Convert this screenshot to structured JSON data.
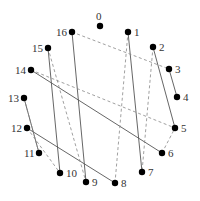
{
  "diagram": {
    "type": "circular-graph",
    "nodes": [
      {
        "id": "0",
        "x": 100,
        "y": 26,
        "lx": 96,
        "ly": 20
      },
      {
        "id": "1",
        "x": 128,
        "y": 32,
        "lx": 134,
        "ly": 36
      },
      {
        "id": "2",
        "x": 153,
        "y": 47,
        "lx": 159,
        "ly": 51
      },
      {
        "id": "3",
        "x": 169,
        "y": 69,
        "lx": 175,
        "ly": 73
      },
      {
        "id": "4",
        "x": 177,
        "y": 97,
        "lx": 183,
        "ly": 101
      },
      {
        "id": "5",
        "x": 175,
        "y": 128,
        "lx": 181,
        "ly": 132
      },
      {
        "id": "6",
        "x": 162,
        "y": 153,
        "lx": 168,
        "ly": 157
      },
      {
        "id": "7",
        "x": 142,
        "y": 172,
        "lx": 148,
        "ly": 176
      },
      {
        "id": "8",
        "x": 115,
        "y": 183,
        "lx": 121,
        "ly": 187
      },
      {
        "id": "9",
        "x": 86,
        "y": 182,
        "lx": 92,
        "ly": 186
      },
      {
        "id": "10",
        "x": 60,
        "y": 173,
        "lx": 66,
        "ly": 177
      },
      {
        "id": "11",
        "x": 39,
        "y": 153,
        "lx": 24,
        "ly": 157
      },
      {
        "id": "12",
        "x": 27,
        "y": 128,
        "lx": 11,
        "ly": 132
      },
      {
        "id": "13",
        "x": 24,
        "y": 98,
        "lx": 8,
        "ly": 102
      },
      {
        "id": "14",
        "x": 31,
        "y": 70,
        "lx": 15,
        "ly": 74
      },
      {
        "id": "15",
        "x": 48,
        "y": 48,
        "lx": 32,
        "ly": 52
      },
      {
        "id": "16",
        "x": 72,
        "y": 32,
        "lx": 56,
        "ly": 36
      }
    ],
    "edges": [
      {
        "from": "16",
        "to": "9",
        "style": "solid"
      },
      {
        "from": "15",
        "to": "10",
        "style": "solid"
      },
      {
        "from": "14",
        "to": "6",
        "style": "solid"
      },
      {
        "from": "1",
        "to": "7",
        "style": "solid"
      },
      {
        "from": "2",
        "to": "5",
        "style": "solid"
      },
      {
        "from": "3",
        "to": "4",
        "style": "solid"
      },
      {
        "from": "12",
        "to": "8",
        "style": "solid"
      },
      {
        "from": "13",
        "to": "11",
        "style": "solid"
      },
      {
        "from": "16",
        "to": "3",
        "style": "dashed"
      },
      {
        "from": "15",
        "to": "9",
        "style": "dashed"
      },
      {
        "from": "14",
        "to": "5",
        "style": "dashed"
      },
      {
        "from": "12",
        "to": "10",
        "style": "dashed"
      },
      {
        "from": "1",
        "to": "8",
        "style": "dashed"
      },
      {
        "from": "2",
        "to": "7",
        "style": "dashed"
      },
      {
        "from": "6",
        "to": "5",
        "style": "dashed"
      },
      {
        "from": "13",
        "to": "11",
        "style": "dashed"
      }
    ],
    "node_radius": 3.2,
    "colors": {
      "node": "#000000",
      "solid_edge": "#555555",
      "dashed_edge": "#888888"
    }
  }
}
